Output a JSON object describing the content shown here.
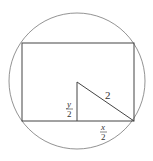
{
  "diagram": {
    "type": "geometry",
    "circle": {
      "cx": 77,
      "cy": 81,
      "r": 68
    },
    "rectangle": {
      "x": 22,
      "y": 43,
      "width": 112,
      "height": 78
    },
    "triangle": {
      "points": [
        [
          77,
          82
        ],
        [
          77,
          121
        ],
        [
          134,
          121
        ]
      ]
    },
    "labels": {
      "hypotenuse": "2",
      "vertical_num": "y",
      "vertical_den": "2",
      "horizontal_num": "x",
      "horizontal_den": "2"
    },
    "colors": {
      "stroke": "#555555",
      "rect_stroke": "#444444"
    }
  }
}
